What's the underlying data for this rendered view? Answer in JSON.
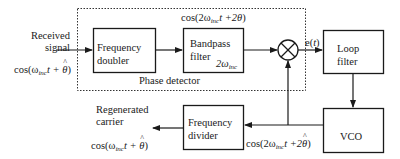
{
  "diagram": {
    "phase_detector_label": "Phase detector",
    "input": {
      "label_line1": "Received",
      "label_line2": "signal",
      "expr_prefix": "cos(ω",
      "expr_sub": "inc",
      "expr_mid": "t + ",
      "expr_theta": "θ",
      "expr_suffix": ")"
    },
    "blocks": {
      "frequency_doubler": {
        "line1": "Frequency",
        "line2": "doubler"
      },
      "bandpass_filter": {
        "line1": "Bandpass",
        "line2": "filter",
        "center_prefix": "2ω",
        "center_sub": "inc"
      },
      "loop_filter": {
        "line1": "Loop",
        "line2": "filter"
      },
      "vco": {
        "line1": "VCO"
      },
      "frequency_divider": {
        "line1": "Frequency",
        "line2": "divider"
      }
    },
    "signals": {
      "bpf_output": {
        "prefix": "cos(2ω",
        "sub": "inc",
        "mid": "t +2",
        "theta": "θ",
        "suffix": ")"
      },
      "error": {
        "prefix": "e(",
        "var": "t",
        "suffix": ")"
      },
      "vco_output": {
        "prefix": "cos(2ω",
        "sub": "inc",
        "mid": "t +2",
        "theta": "θ",
        "suffix": ")"
      }
    },
    "output": {
      "label_line1": "Regenerated",
      "label_line2": "carrier",
      "expr_prefix": "cos(ω",
      "expr_sub": "inc",
      "expr_mid": "t + ",
      "expr_theta": "θ",
      "expr_suffix": ")"
    },
    "colors": {
      "line": "#1a1a1a",
      "background": "#ffffff"
    }
  }
}
